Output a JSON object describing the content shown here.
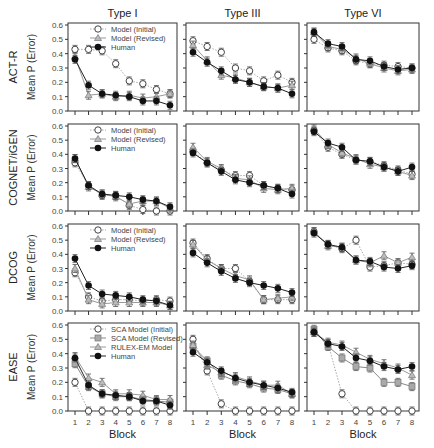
{
  "chart_data": {
    "type": "line",
    "title": "",
    "xlabel": "Block",
    "ylabel": "Mean P (Error)",
    "ylim": [
      0,
      0.6
    ],
    "yticks": [
      "0.0",
      "0.1",
      "0.2",
      "0.3",
      "0.4",
      "0.5",
      "0.6"
    ],
    "x": [
      1,
      2,
      3,
      4,
      5,
      6,
      7,
      8
    ],
    "columns": [
      "Type I",
      "Type III",
      "Type VI"
    ],
    "rows": [
      {
        "label": "ACT-R",
        "legend": [
          {
            "name": "Model (Initial)",
            "marker": "diamond-open"
          },
          {
            "name": "Model (Revised)",
            "marker": "triangle"
          },
          {
            "name": "Human",
            "marker": "circle-filled"
          }
        ],
        "panels": [
          {
            "series": [
              {
                "name": "Model (Initial)",
                "values": [
                  0.43,
                  0.43,
                  0.42,
                  0.33,
                  0.21,
                  0.19,
                  0.15,
                  0.12
                ]
              },
              {
                "name": "Model (Revised)",
                "values": [
                  0.38,
                  0.11,
                  0.12,
                  0.1,
                  0.11,
                  0.09,
                  0.1,
                  0.12
                ]
              },
              {
                "name": "Human",
                "values": [
                  0.36,
                  0.18,
                  0.12,
                  0.11,
                  0.1,
                  0.07,
                  0.07,
                  0.04
                ]
              }
            ]
          },
          {
            "series": [
              {
                "name": "Model (Initial)",
                "values": [
                  0.49,
                  0.45,
                  0.41,
                  0.3,
                  0.28,
                  0.21,
                  0.25,
                  0.2
                ]
              },
              {
                "name": "Model (Revised)",
                "values": [
                  0.46,
                  0.35,
                  0.25,
                  0.23,
                  0.2,
                  0.17,
                  0.16,
                  0.18
                ]
              },
              {
                "name": "Human",
                "values": [
                  0.41,
                  0.34,
                  0.28,
                  0.22,
                  0.2,
                  0.17,
                  0.16,
                  0.12
                ]
              }
            ]
          },
          {
            "series": [
              {
                "name": "Model (Initial)",
                "values": [
                  0.5,
                  0.44,
                  0.42,
                  0.35,
                  0.33,
                  0.32,
                  0.31,
                  0.3
                ]
              },
              {
                "name": "Model (Revised)",
                "values": [
                  0.55,
                  0.45,
                  0.43,
                  0.37,
                  0.33,
                  0.3,
                  0.28,
                  0.29
                ]
              },
              {
                "name": "Human",
                "values": [
                  0.55,
                  0.47,
                  0.45,
                  0.36,
                  0.35,
                  0.31,
                  0.29,
                  0.3
                ]
              }
            ]
          }
        ]
      },
      {
        "label": "COGNET/iGEN",
        "legend": [
          {
            "name": "Model (Initial)",
            "marker": "diamond-open"
          },
          {
            "name": "Model (Revised)",
            "marker": "triangle"
          },
          {
            "name": "Human",
            "marker": "circle-filled"
          }
        ],
        "panels": [
          {
            "series": [
              {
                "name": "Model (Initial)",
                "values": [
                  0.34,
                  0.18,
                  0.11,
                  0.11,
                  0.04,
                  0.01,
                  0.0,
                  0.0
                ]
              },
              {
                "name": "Model (Revised)",
                "values": [
                  0.37,
                  0.17,
                  0.12,
                  0.1,
                  0.05,
                  0.07,
                  0.07,
                  0.02
                ]
              },
              {
                "name": "Human",
                "values": [
                  0.37,
                  0.18,
                  0.12,
                  0.11,
                  0.1,
                  0.08,
                  0.07,
                  0.03
                ]
              }
            ]
          },
          {
            "series": [
              {
                "name": "Model (Initial)",
                "values": [
                  0.42,
                  0.34,
                  0.29,
                  0.25,
                  0.25,
                  0.18,
                  0.16,
                  0.15
                ]
              },
              {
                "name": "Model (Revised)",
                "values": [
                  0.45,
                  0.35,
                  0.3,
                  0.23,
                  0.22,
                  0.16,
                  0.15,
                  0.16
                ]
              },
              {
                "name": "Human",
                "values": [
                  0.41,
                  0.34,
                  0.28,
                  0.22,
                  0.2,
                  0.18,
                  0.16,
                  0.12
                ]
              }
            ]
          },
          {
            "series": [
              {
                "name": "Model (Initial)",
                "values": [
                  0.57,
                  0.45,
                  0.4,
                  0.36,
                  0.35,
                  0.32,
                  0.29,
                  0.26
                ]
              },
              {
                "name": "Model (Revised)",
                "values": [
                  0.58,
                  0.47,
                  0.41,
                  0.37,
                  0.33,
                  0.31,
                  0.28,
                  0.25
                ]
              },
              {
                "name": "Human",
                "values": [
                  0.56,
                  0.48,
                  0.45,
                  0.36,
                  0.35,
                  0.31,
                  0.28,
                  0.31
                ]
              }
            ]
          }
        ]
      },
      {
        "label": "DCOG",
        "legend": [
          {
            "name": "Model (Initial)",
            "marker": "diamond-open"
          },
          {
            "name": "Model (Revised)",
            "marker": "triangle"
          },
          {
            "name": "Human",
            "marker": "circle-filled"
          }
        ],
        "panels": [
          {
            "series": [
              {
                "name": "Model (Initial)",
                "values": [
                  0.27,
                  0.1,
                  0.07,
                  0.08,
                  0.08,
                  0.07,
                  0.08,
                  0.07
                ]
              },
              {
                "name": "Model (Revised)",
                "values": [
                  0.3,
                  0.08,
                  0.05,
                  0.06,
                  0.06,
                  0.06,
                  0.06,
                  0.04
                ]
              },
              {
                "name": "Human",
                "values": [
                  0.37,
                  0.18,
                  0.12,
                  0.11,
                  0.1,
                  0.08,
                  0.07,
                  0.04
                ]
              }
            ]
          },
          {
            "series": [
              {
                "name": "Model (Initial)",
                "values": [
                  0.48,
                  0.37,
                  0.3,
                  0.3,
                  0.21,
                  0.08,
                  0.08,
                  0.08
                ]
              },
              {
                "name": "Model (Revised)",
                "values": [
                  0.47,
                  0.36,
                  0.3,
                  0.25,
                  0.22,
                  0.08,
                  0.09,
                  0.1
                ]
              },
              {
                "name": "Human",
                "values": [
                  0.41,
                  0.34,
                  0.28,
                  0.23,
                  0.2,
                  0.18,
                  0.16,
                  0.13
                ]
              }
            ]
          },
          {
            "series": [
              {
                "name": "Model (Initial)",
                "values": [
                  0.56,
                  0.47,
                  0.44,
                  0.5,
                  0.31,
                  0.32,
                  0.34,
                  0.33
                ]
              },
              {
                "name": "Model (Revised)",
                "values": [
                  0.56,
                  0.46,
                  0.45,
                  0.36,
                  0.34,
                  0.39,
                  0.34,
                  0.38
                ]
              },
              {
                "name": "Human",
                "values": [
                  0.55,
                  0.47,
                  0.45,
                  0.36,
                  0.35,
                  0.31,
                  0.3,
                  0.32
                ]
              }
            ]
          }
        ]
      },
      {
        "label": "EASE",
        "legend": [
          {
            "name": "SCA Model (Initial)",
            "marker": "diamond-open"
          },
          {
            "name": "SCA Model (Revised)",
            "marker": "square-gray"
          },
          {
            "name": "RULEX-EM Model",
            "marker": "triangle"
          },
          {
            "name": "Human",
            "marker": "circle-filled"
          }
        ],
        "panels": [
          {
            "series": [
              {
                "name": "SCA Model (Initial)",
                "values": [
                  0.2,
                  0.0,
                  0.0,
                  0.0,
                  0.0,
                  0.0,
                  0.0,
                  0.0
                ]
              },
              {
                "name": "SCA Model (Revised)",
                "values": [
                  0.33,
                  0.17,
                  0.12,
                  0.1,
                  0.1,
                  0.08,
                  0.07,
                  0.06
                ]
              },
              {
                "name": "RULEX-EM Model",
                "values": [
                  0.38,
                  0.23,
                  0.2,
                  0.12,
                  0.12,
                  0.11,
                  0.08,
                  0.08
                ]
              },
              {
                "name": "Human",
                "values": [
                  0.37,
                  0.18,
                  0.12,
                  0.11,
                  0.1,
                  0.07,
                  0.07,
                  0.04
                ]
              }
            ]
          },
          {
            "series": [
              {
                "name": "SCA Model (Initial)",
                "values": [
                  0.5,
                  0.28,
                  0.05,
                  0.0,
                  0.0,
                  0.0,
                  0.0,
                  0.0
                ]
              },
              {
                "name": "SCA Model (Revised)",
                "values": [
                  0.45,
                  0.35,
                  0.25,
                  0.21,
                  0.19,
                  0.16,
                  0.15,
                  0.12
                ]
              },
              {
                "name": "RULEX-EM Model",
                "values": [
                  0.46,
                  0.32,
                  0.27,
                  0.24,
                  0.21,
                  0.18,
                  0.18,
                  0.12
                ]
              },
              {
                "name": "Human",
                "values": [
                  0.41,
                  0.34,
                  0.28,
                  0.23,
                  0.2,
                  0.18,
                  0.16,
                  0.13
                ]
              }
            ]
          },
          {
            "series": [
              {
                "name": "SCA Model (Initial)",
                "values": [
                  0.55,
                  0.47,
                  0.12,
                  0.0,
                  0.0,
                  0.0,
                  0.0,
                  0.0
                ]
              },
              {
                "name": "SCA Model (Revised)",
                "values": [
                  0.57,
                  0.45,
                  0.37,
                  0.31,
                  0.3,
                  0.2,
                  0.2,
                  0.17
                ]
              },
              {
                "name": "RULEX-EM Model",
                "values": [
                  0.55,
                  0.48,
                  0.46,
                  0.41,
                  0.36,
                  0.33,
                  0.3,
                  0.25
                ]
              },
              {
                "name": "Human",
                "values": [
                  0.55,
                  0.47,
                  0.45,
                  0.37,
                  0.35,
                  0.31,
                  0.29,
                  0.31
                ]
              }
            ]
          }
        ]
      }
    ],
    "styles": {
      "Model (Initial)": {
        "marker": "diamond-open",
        "line": "dotted",
        "color": "#aaaaaa"
      },
      "SCA Model (Initial)": {
        "marker": "diamond-open",
        "line": "dotted",
        "color": "#aaaaaa"
      },
      "Model (Revised)": {
        "marker": "triangle",
        "line": "solid",
        "color": "#999999"
      },
      "RULEX-EM Model": {
        "marker": "triangle",
        "line": "solid",
        "color": "#999999"
      },
      "SCA Model (Revised)": {
        "marker": "square-gray",
        "line": "solid",
        "color": "#888888"
      },
      "Human": {
        "marker": "circle-filled",
        "line": "solid",
        "color": "#222222"
      }
    },
    "grid": false,
    "legend_position": "top-right of first column panels"
  }
}
